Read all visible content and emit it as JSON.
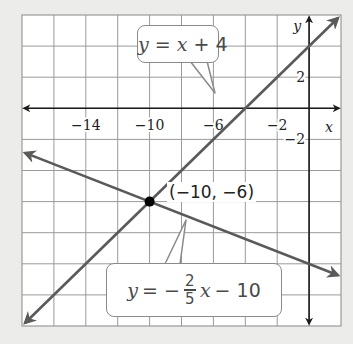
{
  "chart_data": {
    "type": "line",
    "title": "",
    "xlabel": "x",
    "ylabel": "y",
    "xlim": [
      -18,
      2
    ],
    "ylim": [
      -14,
      6
    ],
    "grid": true,
    "grid_step": 2,
    "x_ticks": [
      {
        "value": -14,
        "label": "−14"
      },
      {
        "value": -10,
        "label": "−10"
      },
      {
        "value": -6,
        "label": "−6"
      },
      {
        "value": -2,
        "label": "−2"
      }
    ],
    "y_ticks": [
      {
        "value": 2,
        "label": "2"
      },
      {
        "value": -2,
        "label": "−2"
      }
    ],
    "series": [
      {
        "name": "y = x + 4",
        "slope": 1,
        "intercept": 4,
        "x_range": [
          -18,
          2
        ],
        "color": "#5a5a5a"
      },
      {
        "name": "y = −2/5x − 10",
        "slope": -0.4,
        "intercept": -10,
        "x_range": [
          -18,
          2
        ],
        "color": "#5a5a5a"
      }
    ],
    "points": [
      {
        "x": -10,
        "y": -6,
        "label": "(−10, −6)"
      }
    ],
    "annotations": [
      {
        "text": "y = x + 4",
        "points_to": "line1"
      },
      {
        "text": "y = −2/5 x − 10",
        "points_to": "line2"
      }
    ]
  },
  "labels": {
    "eq1_y": "y",
    "eq1_rest": " = ",
    "eq1_x": "x",
    "eq1_tail": " + 4",
    "eq2_y": "y",
    "eq2_eq": " = −",
    "eq2_num": "2",
    "eq2_den": "5",
    "eq2_x": "x",
    "eq2_tail": " − 10",
    "point": "(−10, −6)"
  },
  "colors": {
    "grid": "#9a9a9a",
    "axis": "#1a1a1a",
    "line": "#5a5a5a",
    "point": "#000000",
    "background": "#ececea",
    "plot_bg": "#ffffff"
  }
}
